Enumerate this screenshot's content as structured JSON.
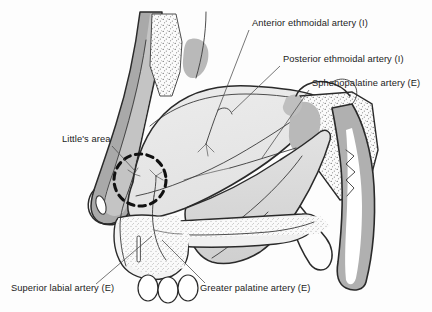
{
  "figure": {
    "view": "Sagittal section of the lateral nasal wall / nasal septum"
  },
  "colors": {
    "background": "#fdfdfd",
    "outline": "#2a2a2a",
    "septum_fill": "#e9e9e9",
    "septum_fill_light": "#f1f1f1",
    "skin_dorsum": "#a9a9a9",
    "skin_dorsum_dark": "#8f8f8f",
    "sinus_blob": "#b9b9b9",
    "bone_stipple": "#6f6f6f",
    "pharynx_band": "#b0b0b0",
    "airway_white": "#ffffff",
    "palate_shade": "#d8d8d8",
    "leader_line": "#4a4a4a",
    "dashed_circle": "#111111",
    "text": "#1b1b1b"
  },
  "labels": [
    {
      "id": "anterior-ethmoidal",
      "text": "Anterior ethmoidal artery (I)",
      "supply_type": "I",
      "x": 252,
      "y": 26,
      "anchor": "start"
    },
    {
      "id": "posterior-ethmoidal",
      "text": "Posterior ethmoidal artery (I)",
      "supply_type": "I",
      "x": 283,
      "y": 62,
      "anchor": "start"
    },
    {
      "id": "sphenopalatine",
      "text": "Sphenopalatine artery (E)",
      "supply_type": "E",
      "x": 312,
      "y": 86,
      "anchor": "start"
    },
    {
      "id": "littles-area",
      "text": "Little's area",
      "supply_type": "",
      "x": 62,
      "y": 142,
      "anchor": "start"
    },
    {
      "id": "superior-labial",
      "text": "Superior labial artery (E)",
      "supply_type": "E",
      "x": 11,
      "y": 291,
      "anchor": "start"
    },
    {
      "id": "greater-palatine",
      "text": "Greater palatine artery (E)",
      "supply_type": "E",
      "x": 200,
      "y": 291,
      "anchor": "start"
    }
  ],
  "legend_key": {
    "internal_marker": "(I)",
    "internal_meaning": "Internal carotid system",
    "external_marker": "(E)",
    "external_meaning": "External carotid system"
  },
  "annotations": {
    "littles_area_marker": "dashed-circle",
    "littles_area_center_x": 140,
    "littles_area_center_y": 180,
    "littles_area_radius": 26
  }
}
